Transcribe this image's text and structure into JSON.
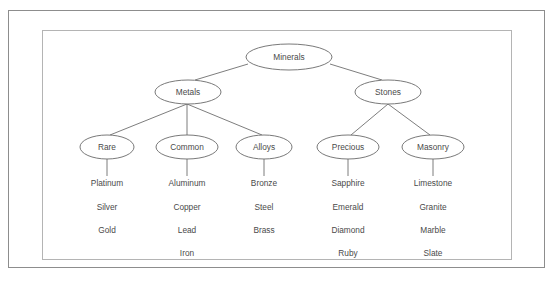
{
  "diagram": {
    "style": {
      "background": "#ffffff",
      "outer_frame_color": "#8d8d8d",
      "inner_frame_color": "#b4b4b4",
      "node_stroke": "#6a6a6a",
      "edge_stroke": "#6e6e6e",
      "text_color": "#4a4a4a"
    },
    "nodes": {
      "root": {
        "label": "Minerals",
        "cx": 289,
        "cy": 57,
        "rx": 43,
        "ry": 13
      },
      "metals": {
        "label": "Metals",
        "cx": 188,
        "cy": 92,
        "rx": 33,
        "ry": 12
      },
      "stones": {
        "label": "Stones",
        "cx": 388,
        "cy": 92,
        "rx": 33,
        "ry": 12
      },
      "rare": {
        "label": "Rare",
        "cx": 107,
        "cy": 147,
        "rx": 27,
        "ry": 12
      },
      "common": {
        "label": "Common",
        "cx": 187,
        "cy": 147,
        "rx": 31,
        "ry": 12
      },
      "alloys": {
        "label": "Alloys",
        "cx": 264,
        "cy": 147,
        "rx": 28,
        "ry": 12
      },
      "precious": {
        "label": "Precious",
        "cx": 348,
        "cy": 147,
        "rx": 31,
        "ry": 12
      },
      "masonry": {
        "label": "Masonry",
        "cx": 433,
        "cy": 147,
        "rx": 31,
        "ry": 12
      }
    },
    "leaves": {
      "rare": [
        "Platinum",
        "Silver",
        "Gold"
      ],
      "common": [
        "Aluminum",
        "Copper",
        "Lead",
        "Iron"
      ],
      "alloys": [
        "Bronze",
        "Steel",
        "Brass"
      ],
      "precious": [
        "Sapphire",
        "Emerald",
        "Diamond",
        "Ruby"
      ],
      "masonry": [
        "Limestone",
        "Granite",
        "Marble",
        "Slate"
      ]
    },
    "leaf_rows_y": [
      184,
      208,
      231,
      254
    ]
  }
}
